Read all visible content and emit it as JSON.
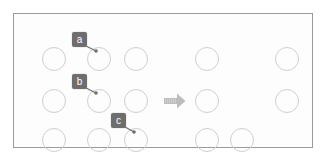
{
  "figure": {
    "title": "",
    "background_color": "#ffffff",
    "panel": {
      "border_color": "#9a9a9a",
      "fill_color": "#fdfdfd",
      "x": 13,
      "y": 13,
      "width": 300,
      "height": 135
    }
  },
  "colors": {
    "circle_stroke": "#cfcfcf",
    "badge_fill": "#6e6e6e",
    "badge_text": "#ffffff",
    "leader_line": "#6e6e6e",
    "arrow_fill": "#bdbdbd",
    "panel_border": "#9a9a9a"
  },
  "chart_data": {
    "type": "diagram",
    "title": "",
    "circle_diameter": 24,
    "rows": [
      {
        "row": 1,
        "cy": 45,
        "left_group_cx": [
          40,
          85,
          122
        ],
        "right_group_cx": [
          193,
          273
        ]
      },
      {
        "row": 2,
        "cy": 87,
        "left_group_cx": [
          40,
          85,
          122
        ],
        "right_group_cx": [
          193,
          273
        ]
      },
      {
        "row": 3,
        "cy": 126,
        "left_group_cx": [
          40,
          85,
          122
        ],
        "right_group_cx": [
          193,
          228
        ]
      }
    ]
  },
  "circles": [
    {
      "name": "circle-r1c1",
      "cx": 40,
      "cy": 45,
      "group": "left",
      "row": 1,
      "col": 1
    },
    {
      "name": "circle-r1c2",
      "cx": 85,
      "cy": 45,
      "group": "left",
      "row": 1,
      "col": 2
    },
    {
      "name": "circle-r1c3",
      "cx": 122,
      "cy": 45,
      "group": "left",
      "row": 1,
      "col": 3
    },
    {
      "name": "circle-r1c4",
      "cx": 193,
      "cy": 45,
      "group": "right",
      "row": 1,
      "col": 4
    },
    {
      "name": "circle-r1c5",
      "cx": 273,
      "cy": 45,
      "group": "right",
      "row": 1,
      "col": 5
    },
    {
      "name": "circle-r2c1",
      "cx": 40,
      "cy": 87,
      "group": "left",
      "row": 2,
      "col": 1
    },
    {
      "name": "circle-r2c2",
      "cx": 85,
      "cy": 87,
      "group": "left",
      "row": 2,
      "col": 2
    },
    {
      "name": "circle-r2c3",
      "cx": 122,
      "cy": 87,
      "group": "left",
      "row": 2,
      "col": 3
    },
    {
      "name": "circle-r2c4",
      "cx": 193,
      "cy": 87,
      "group": "right",
      "row": 2,
      "col": 4
    },
    {
      "name": "circle-r2c5",
      "cx": 273,
      "cy": 87,
      "group": "right",
      "row": 2,
      "col": 5
    },
    {
      "name": "circle-r3c1",
      "cx": 40,
      "cy": 126,
      "group": "left",
      "row": 3,
      "col": 1
    },
    {
      "name": "circle-r3c2",
      "cx": 85,
      "cy": 126,
      "group": "left",
      "row": 3,
      "col": 2
    },
    {
      "name": "circle-r3c3",
      "cx": 122,
      "cy": 126,
      "group": "left",
      "row": 3,
      "col": 3
    },
    {
      "name": "circle-r3c4",
      "cx": 193,
      "cy": 126,
      "group": "right",
      "row": 3,
      "col": 4
    },
    {
      "name": "circle-r3c5",
      "cx": 228,
      "cy": 126,
      "group": "right",
      "row": 3,
      "col": 5
    }
  ],
  "callouts": [
    {
      "id": "a",
      "label": "a",
      "badge": {
        "x": 58,
        "y": 18,
        "width": 15,
        "height": 15
      },
      "leader": {
        "x1": 72,
        "y1": 32,
        "x2": 82,
        "y2": 37
      },
      "target_circle": "circle-r1c2"
    },
    {
      "id": "b",
      "label": "b",
      "badge": {
        "x": 58,
        "y": 60,
        "width": 15,
        "height": 15
      },
      "leader": {
        "x1": 72,
        "y1": 74,
        "x2": 82,
        "y2": 79
      },
      "target_circle": "circle-r2c2"
    },
    {
      "id": "c",
      "label": "c",
      "badge": {
        "x": 97,
        "y": 99,
        "width": 15,
        "height": 15
      },
      "leader": {
        "x1": 111,
        "y1": 113,
        "x2": 120,
        "y2": 118
      },
      "target_circle": "circle-r3c3"
    }
  ],
  "arrow": {
    "name": "transform-arrow",
    "direction": "right",
    "x": 150,
    "y": 79,
    "width": 22,
    "height": 16
  }
}
